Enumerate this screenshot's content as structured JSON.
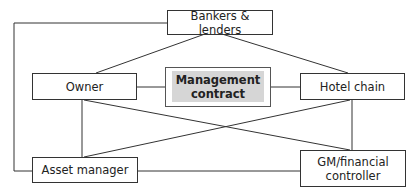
{
  "diagram": {
    "type": "stakeholder-relationship-diagram",
    "center": {
      "label_line1": "Management",
      "label_line2": "contract"
    },
    "nodes": {
      "bankers": {
        "label": "Bankers & lenders"
      },
      "owner": {
        "label": "Owner"
      },
      "hotel_chain": {
        "label": "Hotel chain"
      },
      "asset_manager": {
        "label": "Asset manager"
      },
      "gm": {
        "label_line1": "GM/financial",
        "label_line2": "controller"
      }
    },
    "edges": [
      [
        "Bankers & lenders",
        "Owner"
      ],
      [
        "Bankers & lenders",
        "Hotel chain"
      ],
      [
        "Bankers & lenders",
        "Asset manager"
      ],
      [
        "Owner",
        "Management contract"
      ],
      [
        "Management contract",
        "Hotel chain"
      ],
      [
        "Owner",
        "Asset manager"
      ],
      [
        "Owner",
        "GM/financial controller"
      ],
      [
        "Hotel chain",
        "GM/financial controller"
      ],
      [
        "Hotel chain",
        "Asset manager"
      ],
      [
        "Asset manager",
        "GM/financial controller"
      ]
    ],
    "colors": {
      "line": "#333333",
      "center_fill": "#d6d6d6"
    }
  }
}
